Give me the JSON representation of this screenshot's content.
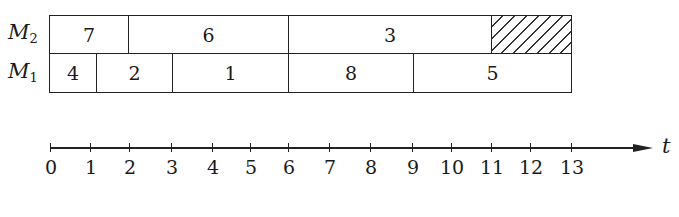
{
  "diagram": {
    "type": "gantt-schedule",
    "machines": [
      {
        "id": "M2",
        "label": "M",
        "subscript": "2",
        "tasks": [
          {
            "label": "7",
            "start": 0,
            "end": 2
          },
          {
            "label": "6",
            "start": 2,
            "end": 6
          },
          {
            "label": "3",
            "start": 6,
            "end": 11
          },
          {
            "label": "",
            "start": 11,
            "end": 13,
            "idle": true
          }
        ]
      },
      {
        "id": "M1",
        "label": "M",
        "subscript": "1",
        "tasks": [
          {
            "label": "4",
            "start": 0,
            "end": 1.2
          },
          {
            "label": "2",
            "start": 1.2,
            "end": 3.1
          },
          {
            "label": "1",
            "start": 3.1,
            "end": 6
          },
          {
            "label": "8",
            "start": 6,
            "end": 9.1
          },
          {
            "label": "5",
            "start": 9.1,
            "end": 13
          }
        ]
      }
    ],
    "axis": {
      "name": "t",
      "ticks": [
        "0",
        "1",
        "2",
        "3",
        "4",
        "5",
        "6",
        "7",
        "8",
        "9",
        "10",
        "11",
        "12",
        "13"
      ]
    }
  }
}
